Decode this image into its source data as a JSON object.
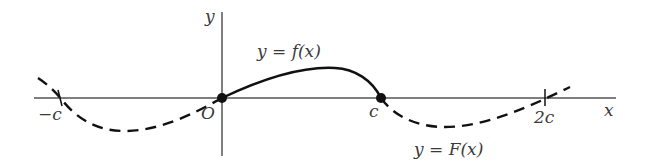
{
  "diagram": {
    "axes": {
      "x_label": "x",
      "y_label": "y",
      "origin_label": "O"
    },
    "ticks": {
      "neg_c": "−c",
      "c": "c",
      "two_c": "2c"
    },
    "curves": {
      "f_label": "y = f(x)",
      "F_label": "y = F(x)"
    },
    "colors": {
      "axis": "#555555",
      "curve": "#111111",
      "text": "#3a3a3a"
    }
  }
}
